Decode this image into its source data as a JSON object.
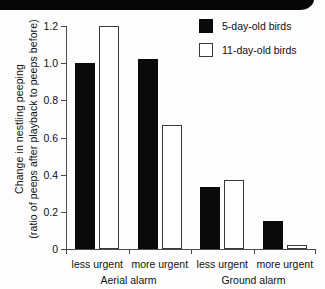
{
  "chart_data": {
    "type": "bar",
    "title": "",
    "xlabel": "",
    "ylabel": "Change in nestling peeping (ratio of peeps after playback to peeps before)",
    "ylabel_line1": "Change in nestling peeping",
    "ylabel_line2": "(ratio of peeps after playback to peeps before)",
    "ylim": [
      0,
      1.2
    ],
    "ytick_labels": [
      "1.2",
      "1.0",
      "0.8",
      "0.6",
      "0.4",
      "0.2",
      "0"
    ],
    "ytick_values": [
      1.2,
      1.0,
      0.8,
      0.6,
      0.4,
      0.2,
      0
    ],
    "grid": false,
    "legend_position": "top-right",
    "categories": [
      "less urgent",
      "more urgent",
      "less urgent",
      "more urgent"
    ],
    "groups": [
      {
        "name": "Aerial alarm",
        "categories": [
          "less urgent",
          "more urgent"
        ]
      },
      {
        "name": "Ground alarm",
        "categories": [
          "less urgent",
          "more urgent"
        ]
      }
    ],
    "series": [
      {
        "name": "5-day-old birds",
        "color": "#0a0a0a",
        "style": "filled",
        "values": [
          1.0,
          1.02,
          0.335,
          0.15
        ]
      },
      {
        "name": "11-day-old birds",
        "color": "#ffffff",
        "style": "open",
        "values": [
          1.2,
          0.67,
          0.372,
          0.02
        ]
      }
    ]
  },
  "legend": {
    "items": [
      {
        "label": "5-day-old birds",
        "style": "filled"
      },
      {
        "label": "11-day-old birds",
        "style": "open"
      }
    ]
  }
}
